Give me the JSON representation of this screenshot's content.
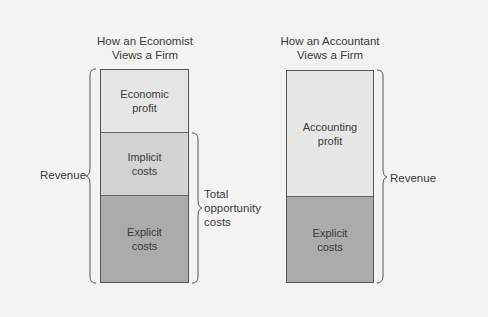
{
  "economist": {
    "title": "How an Economist\nViews a Firm",
    "segments": [
      {
        "label": "Economic\nprofit",
        "color": "#e6e6e5"
      },
      {
        "label": "Implicit\ncosts",
        "color": "#d3d3d2"
      },
      {
        "label": "Explicit\ncosts",
        "color": "#ababab"
      }
    ],
    "left_brace_label": "Revenue",
    "right_brace_label": "Total\nopportunity\ncosts"
  },
  "accountant": {
    "title": "How an Accountant\nViews a Firm",
    "segments": [
      {
        "label": "Accounting\nprofit",
        "color": "#e6e6e5"
      },
      {
        "label": "Explicit\ncosts",
        "color": "#ababab"
      }
    ],
    "right_brace_label": "Revenue"
  }
}
